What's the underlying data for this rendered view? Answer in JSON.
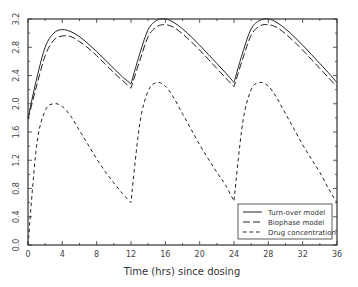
{
  "chart_data": {
    "type": "line",
    "title": "",
    "xlabel": "Time (hrs) since dosing",
    "ylabel": "",
    "xlim": [
      0,
      36
    ],
    "ylim": [
      0.0,
      3.2
    ],
    "x_ticks": [
      0,
      4,
      8,
      12,
      16,
      20,
      24,
      28,
      32,
      36
    ],
    "x_tick_labels": [
      "0",
      "4",
      "8",
      "12",
      "16",
      "20",
      "24",
      "28",
      "32",
      "36"
    ],
    "y_ticks": [
      0.0,
      0.4,
      0.8,
      1.2,
      1.6,
      2.0,
      2.4,
      2.8,
      3.2
    ],
    "y_tick_labels": [
      "0.0",
      "0.4",
      "0.8",
      "1.2",
      "1.6",
      "2.0",
      "2.4",
      "2.8",
      "3.2"
    ],
    "grid": false,
    "legend_position": "lower right",
    "x": [
      0,
      1,
      2,
      3,
      4,
      5,
      6,
      7,
      8,
      9,
      10,
      11,
      12,
      13,
      14,
      15,
      16,
      17,
      18,
      19,
      20,
      21,
      22,
      23,
      24,
      25,
      26,
      27,
      28,
      29,
      30,
      31,
      32,
      33,
      34,
      35,
      36
    ],
    "series": [
      {
        "name": "Turn-over model",
        "style": "solid",
        "values": [
          1.8,
          2.35,
          2.8,
          3.0,
          3.05,
          3.02,
          2.95,
          2.85,
          2.74,
          2.62,
          2.5,
          2.38,
          2.28,
          2.7,
          3.05,
          3.18,
          3.2,
          3.15,
          3.06,
          2.95,
          2.83,
          2.7,
          2.57,
          2.44,
          2.3,
          2.72,
          3.06,
          3.18,
          3.2,
          3.15,
          3.06,
          2.95,
          2.83,
          2.7,
          2.57,
          2.44,
          2.3
        ]
      },
      {
        "name": "Biophase model",
        "style": "dashed-long",
        "values": [
          1.78,
          2.25,
          2.68,
          2.9,
          2.96,
          2.95,
          2.88,
          2.79,
          2.68,
          2.56,
          2.44,
          2.33,
          2.22,
          2.6,
          2.95,
          3.09,
          3.12,
          3.08,
          2.99,
          2.88,
          2.76,
          2.63,
          2.5,
          2.37,
          2.24,
          2.63,
          2.97,
          3.1,
          3.12,
          3.08,
          2.99,
          2.88,
          2.76,
          2.63,
          2.5,
          2.37,
          2.24
        ]
      },
      {
        "name": "Drug concentration",
        "style": "dashed-short",
        "values": [
          0.0,
          1.4,
          1.9,
          2.0,
          1.96,
          1.82,
          1.62,
          1.42,
          1.22,
          1.04,
          0.88,
          0.73,
          0.6,
          1.7,
          2.18,
          2.3,
          2.25,
          2.08,
          1.86,
          1.64,
          1.42,
          1.22,
          1.03,
          0.85,
          0.62,
          1.72,
          2.2,
          2.3,
          2.25,
          2.08,
          1.86,
          1.64,
          1.42,
          1.22,
          1.03,
          0.8,
          0.6
        ]
      }
    ]
  }
}
